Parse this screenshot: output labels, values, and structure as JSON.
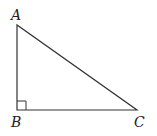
{
  "diagram": {
    "type": "right-triangle",
    "vertices": [
      {
        "label": "A",
        "x": 17,
        "y": 25
      },
      {
        "label": "B",
        "x": 17,
        "y": 110
      },
      {
        "label": "C",
        "x": 137,
        "y": 110
      }
    ],
    "right_angle_at": "B",
    "stroke_color": "#333333",
    "labels": {
      "A": "A",
      "B": "B",
      "C": "C"
    }
  }
}
